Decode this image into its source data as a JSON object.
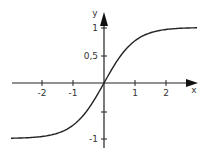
{
  "chart_data": {
    "type": "line",
    "title": "",
    "xlabel": "x",
    "ylabel": "y",
    "xlim": [
      -3.0,
      3.0
    ],
    "ylim": [
      -1.15,
      1.2
    ],
    "x_ticks": [
      -2,
      -1,
      1,
      2
    ],
    "x_tick_labels": [
      "-2",
      "-1",
      "1",
      "2"
    ],
    "y_ticks": [
      1,
      0.5,
      -0.5,
      -1
    ],
    "y_tick_labels": [
      "1",
      "0,5",
      "",
      "-1"
    ],
    "grid": false,
    "legend": null,
    "series": [
      {
        "name": "tanh(x)",
        "x": [
          -3.0,
          -2.5,
          -2.0,
          -1.5,
          -1.0,
          -0.5,
          0.0,
          0.5,
          1.0,
          1.5,
          2.0,
          2.5,
          3.0
        ],
        "y": [
          -0.995,
          -0.987,
          -0.964,
          -0.905,
          -0.762,
          -0.462,
          0.0,
          0.462,
          0.762,
          0.905,
          0.964,
          0.987,
          0.995
        ]
      }
    ],
    "colors": {
      "curve": "#222222",
      "axes": "#222222"
    }
  },
  "labels": {
    "x_axis": "x",
    "y_axis": "y",
    "xt_m2": "-2",
    "xt_m1": "-1",
    "xt_1": "1",
    "xt_2": "2",
    "yt_1": "1",
    "yt_05": "0,5",
    "yt_m1": "-1"
  }
}
